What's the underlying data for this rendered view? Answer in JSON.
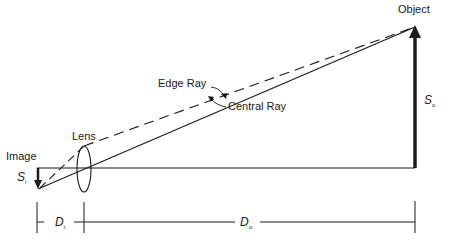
{
  "diagram": {
    "labels": {
      "object": "Object",
      "image": "Image",
      "lens": "Lens",
      "edge_ray": "Edge Ray",
      "central_ray": "Central Ray"
    },
    "symbols": {
      "object_size": {
        "main": "S",
        "sub": "o"
      },
      "image_size": {
        "main": "S",
        "sub": "i"
      },
      "image_distance": {
        "main": "D",
        "sub": "i"
      },
      "object_distance": {
        "main": "D",
        "sub": "o"
      }
    },
    "colors": {
      "stroke": "#1a1a1a",
      "background": "#ffffff"
    }
  }
}
